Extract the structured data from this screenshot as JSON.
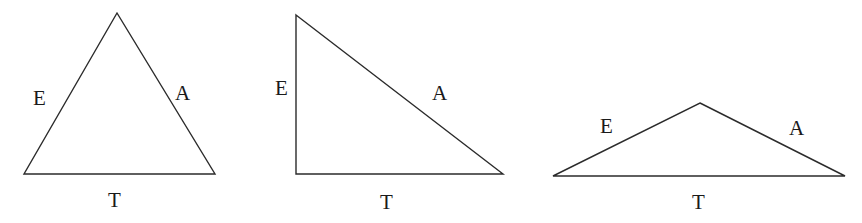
{
  "figure": {
    "background_color": "#ffffff",
    "stroke_color": "#2b2b2b",
    "label_color": "#1a1a1a",
    "stroke_width": 1.4,
    "width": 862,
    "height": 223,
    "shapes": [
      {
        "id": "triangle-1",
        "name": "acute-isosceles-triangle",
        "points": "117,13 215,174 24,174",
        "vertices": [
          {
            "x": 117,
            "y": 13
          },
          {
            "x": 215,
            "y": 174
          },
          {
            "x": 24,
            "y": 174
          }
        ],
        "labels": [
          {
            "id": "label-e-1",
            "text": "E",
            "x": 33,
            "y": 88
          },
          {
            "id": "label-a-1",
            "text": "A",
            "x": 175,
            "y": 83
          },
          {
            "id": "label-t-1",
            "text": "T",
            "x": 108,
            "y": 190
          }
        ]
      },
      {
        "id": "triangle-2",
        "name": "right-triangle",
        "points": "296,15 503,174 296,174",
        "vertices": [
          {
            "x": 296,
            "y": 15
          },
          {
            "x": 503,
            "y": 174
          },
          {
            "x": 296,
            "y": 174
          }
        ],
        "labels": [
          {
            "id": "label-e-2",
            "text": "E",
            "x": 275,
            "y": 78
          },
          {
            "id": "label-a-2",
            "text": "A",
            "x": 432,
            "y": 83
          },
          {
            "id": "label-t-2",
            "text": "T",
            "x": 380,
            "y": 192
          }
        ]
      },
      {
        "id": "triangle-3",
        "name": "obtuse-flat-triangle",
        "points": "700,103 845,176 553,176",
        "vertices": [
          {
            "x": 700,
            "y": 103
          },
          {
            "x": 845,
            "y": 176
          },
          {
            "x": 553,
            "y": 176
          }
        ],
        "labels": [
          {
            "id": "label-e-3",
            "text": "E",
            "x": 600,
            "y": 116
          },
          {
            "id": "label-a-3",
            "text": "A",
            "x": 789,
            "y": 118
          },
          {
            "id": "label-t-3",
            "text": "T",
            "x": 692,
            "y": 192
          }
        ]
      }
    ]
  },
  "labels": {
    "t1_e": "E",
    "t1_a": "A",
    "t1_t": "T",
    "t2_e": "E",
    "t2_a": "A",
    "t2_t": "T",
    "t3_e": "E",
    "t3_a": "A",
    "t3_t": "T"
  }
}
